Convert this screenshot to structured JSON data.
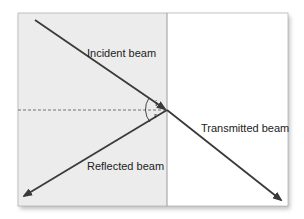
{
  "diagram": {
    "labels": {
      "incident": "Incident beam",
      "reflected": "Reflected beam",
      "transmitted": "Transmitted beam",
      "angle_incidence": "i",
      "angle_reflection": "r"
    },
    "colors": {
      "medium_left": "#ececec",
      "medium_right": "#ffffff",
      "beam": "#3a3a3a",
      "border": "#9a9a9a"
    }
  }
}
